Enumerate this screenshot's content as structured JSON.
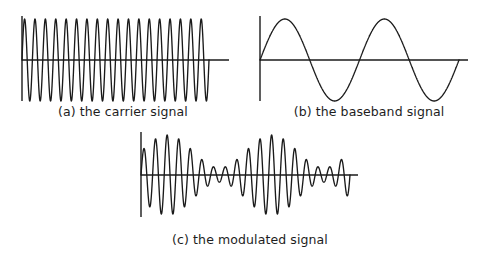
{
  "figure": {
    "background_color": "#ffffff",
    "stroke_color": "#1a1a1a",
    "axis_color": "#1a1a1a",
    "panels": [
      {
        "id": "a",
        "caption": "(a) the carrier signal"
      },
      {
        "id": "b",
        "caption": "(b) the baseband signal"
      },
      {
        "id": "c",
        "caption": "(c) the modulated signal"
      }
    ]
  },
  "chart_data": [
    {
      "type": "line",
      "id": "carrier",
      "title": "(a) the carrier signal",
      "xlabel": "",
      "ylabel": "",
      "grid": false,
      "legend": "none",
      "waveform": "sine",
      "cycles": 18,
      "amplitude": 1.0,
      "phase": 0,
      "xlim": [
        0,
        1
      ],
      "ylim": [
        -1.15,
        1.15
      ],
      "axis": {
        "x_axis_start": 0,
        "x_axis_end": 1.1,
        "y_axis_top": 1.15,
        "y_axis_bottom": -1.15,
        "wave_start": 0,
        "wave_end": 1.0
      }
    },
    {
      "type": "line",
      "id": "baseband",
      "title": "(b) the baseband signal",
      "xlabel": "",
      "ylabel": "",
      "grid": false,
      "legend": "none",
      "waveform": "sine",
      "cycles": 2,
      "amplitude": 1.0,
      "phase": 0,
      "xlim": [
        0,
        1
      ],
      "ylim": [
        -1.15,
        1.15
      ],
      "axis": {
        "x_axis_start": 0,
        "x_axis_end": 1.05,
        "y_axis_top": 1.15,
        "y_axis_bottom": -1.15,
        "wave_start": 0,
        "wave_end": 1.0
      }
    },
    {
      "type": "line",
      "id": "modulated",
      "title": "(c) the modulated signal",
      "xlabel": "",
      "ylabel": "",
      "grid": false,
      "legend": "none",
      "waveform": "amplitude-modulated-sine",
      "carrier_cycles": 18,
      "envelope_cycles": 2,
      "modulation_index": 0.82,
      "amplitude": 1.0,
      "phase": 0,
      "xlim": [
        0,
        1
      ],
      "ylim": [
        -1.15,
        1.15
      ],
      "axis": {
        "x_axis_start": 0,
        "x_axis_end": 1.05,
        "y_axis_top": 1.15,
        "y_axis_bottom": -1.15,
        "wave_start": 0,
        "wave_end": 1.0
      }
    }
  ]
}
